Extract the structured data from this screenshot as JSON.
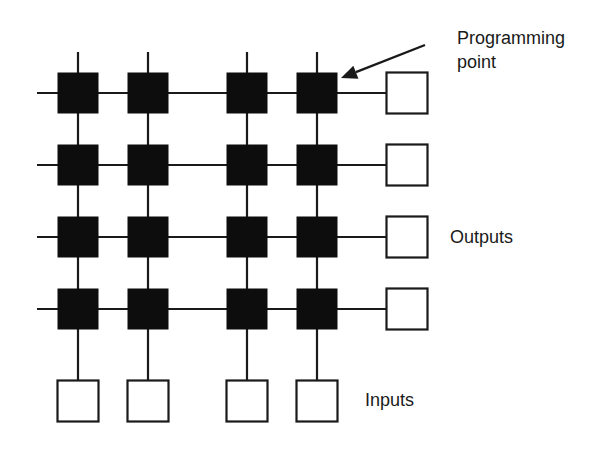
{
  "diagram": {
    "colors": {
      "background": "#ffffff",
      "line": "#1a1a1a",
      "programming_point_fill": "#0d0d0d",
      "io_box_fill": "#ffffff",
      "io_box_stroke": "#1a1a1a"
    },
    "grid": {
      "columns_x": [
        78,
        148,
        247,
        317
      ],
      "rows_y": [
        93,
        165,
        237,
        309
      ],
      "cell_size": 41,
      "io_box_size": 41,
      "left_line_start_x": 37,
      "top_line_start_y": 52,
      "output_box_center_x": 407,
      "input_box_center_y": 401
    },
    "labels": {
      "programming_point_line1": "Programming",
      "programming_point_line2": "point",
      "outputs": "Outputs",
      "inputs": "Inputs"
    },
    "arrow": {
      "from": [
        425,
        45
      ],
      "to": [
        341,
        78
      ]
    }
  }
}
